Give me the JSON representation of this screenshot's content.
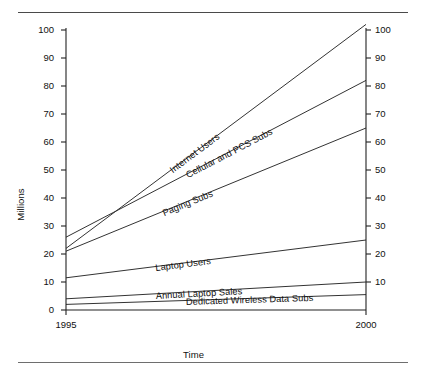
{
  "figure": {
    "has_top_rule": true,
    "has_bottom_rule": true,
    "line_color": "#333333",
    "axis_color": "#222222",
    "background": "#ffffff"
  },
  "chart_data": {
    "type": "line",
    "title": "",
    "subtitle": "",
    "xlabel": "Time",
    "ylabel": "Millions",
    "ylabel_right": "Millions",
    "x": [
      1995,
      2000
    ],
    "xlim": [
      1995,
      2000
    ],
    "ylim": [
      0,
      100
    ],
    "yticks": [
      0,
      10,
      20,
      30,
      40,
      50,
      60,
      70,
      80,
      90,
      100
    ],
    "ytick_labels": [
      "0",
      "10",
      "20",
      "30",
      "40",
      "50",
      "60",
      "70",
      "80",
      "90",
      "100"
    ],
    "right_axis": true,
    "right_yticks": [
      0,
      10,
      20,
      30,
      40,
      50,
      60,
      70,
      80,
      90,
      100
    ],
    "right_ytick_labels": [
      "0",
      "10",
      "20",
      "30",
      "40",
      "50",
      "60",
      "70",
      "80",
      "90",
      "100"
    ],
    "xticks": [
      1995,
      2000
    ],
    "xtick_labels": [
      "1995",
      "2000"
    ],
    "grid": false,
    "legend": "inline-labels",
    "legend_position": "on-line",
    "series": [
      {
        "name": "Internet Users",
        "values": [
          22.0,
          102.0
        ]
      },
      {
        "name": "Cellular and PCS Subs",
        "values": [
          26.0,
          82.0
        ]
      },
      {
        "name": "Paging Subs",
        "values": [
          21.0,
          65.0
        ]
      },
      {
        "name": "Laptop Users",
        "values": [
          11.5,
          25.0
        ]
      },
      {
        "name": "Annual Laptop Sales",
        "values": [
          4.0,
          10.0
        ]
      },
      {
        "name": "Dedicated Wireless Data Subs",
        "values": [
          2.0,
          5.5
        ]
      }
    ]
  },
  "axes": {
    "y_left_ticks": [
      {
        "label": "100"
      },
      {
        "label": "90"
      },
      {
        "label": "80"
      },
      {
        "label": "70"
      },
      {
        "label": "60"
      },
      {
        "label": "50"
      },
      {
        "label": "40"
      },
      {
        "label": "30"
      },
      {
        "label": "20"
      },
      {
        "label": "10"
      },
      {
        "label": "0"
      }
    ],
    "y_right_ticks": [
      {
        "label": "100"
      },
      {
        "label": "90"
      },
      {
        "label": "80"
      },
      {
        "label": "70"
      },
      {
        "label": "60"
      },
      {
        "label": "50"
      },
      {
        "label": "40"
      },
      {
        "label": "30"
      },
      {
        "label": "20"
      },
      {
        "label": "10"
      }
    ],
    "x_ticks": [
      {
        "label": "1995"
      },
      {
        "label": "2000"
      }
    ]
  },
  "labels": {
    "y_axis_title": "Millions",
    "x_axis_title": "Time",
    "internet_users": "Internet Users",
    "cellular_pcs": "Cellular and PCS Subs",
    "paging_subs": "Paging Subs",
    "laptop_users": "Laptop Users",
    "annual_laptop_sales": "Annual Laptop Sales",
    "dedicated_wireless": "Dedicated Wireless Data Subs"
  }
}
